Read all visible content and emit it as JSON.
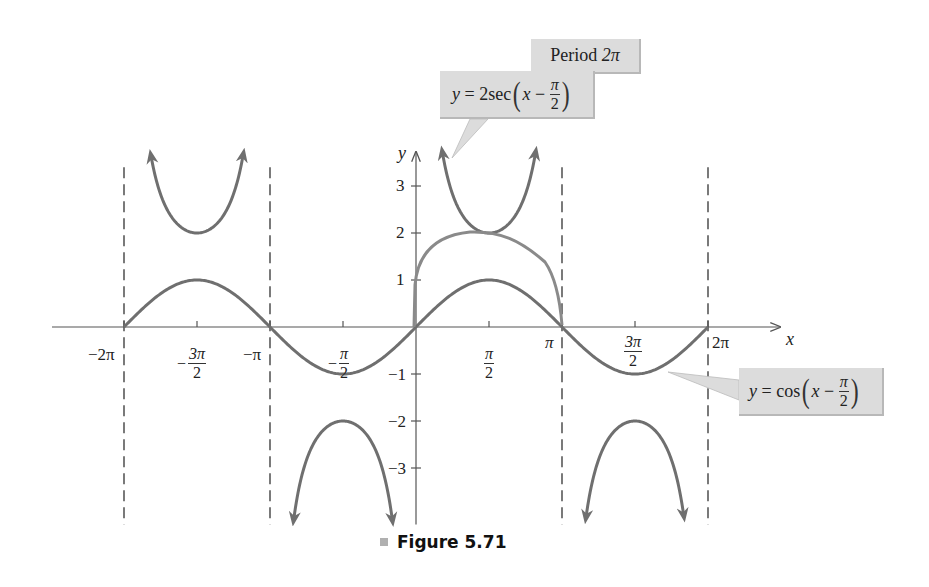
{
  "chart_data": {
    "type": "line",
    "title": "",
    "caption": "Figure 5.71",
    "xlabel": "x",
    "ylabel": "y",
    "xlim": [
      -6.2832,
      7.0
    ],
    "ylim": [
      -4.2,
      4.0
    ],
    "grid": false,
    "legend": "callouts",
    "x_ticks": [
      {
        "value": -6.2832,
        "label": "−2π"
      },
      {
        "value": -4.7124,
        "label": "−3π/2"
      },
      {
        "value": -3.1416,
        "label": "−π"
      },
      {
        "value": -1.5708,
        "label": "−π/2"
      },
      {
        "value": 1.5708,
        "label": "π/2"
      },
      {
        "value": 3.1416,
        "label": "π"
      },
      {
        "value": 4.7124,
        "label": "3π/2"
      },
      {
        "value": 6.2832,
        "label": "2π"
      }
    ],
    "y_ticks": [
      {
        "value": 3,
        "label": "3"
      },
      {
        "value": 2,
        "label": "2"
      },
      {
        "value": 1,
        "label": "1"
      },
      {
        "value": -1,
        "label": "−1"
      },
      {
        "value": -2,
        "label": "−2"
      },
      {
        "value": -3,
        "label": "−3"
      }
    ],
    "series": [
      {
        "name": "y = cos(x − π/2)",
        "expression": "cos(x - pi/2)",
        "x_range": [
          -6.2832,
          6.2832
        ],
        "x": [
          -6.2832,
          -4.7124,
          -3.1416,
          -1.5708,
          0,
          1.5708,
          3.1416,
          4.7124,
          6.2832
        ],
        "values": [
          0,
          1,
          0,
          -1,
          0,
          1,
          0,
          -1,
          0
        ]
      },
      {
        "name": "y = 2sec(x − π/2)",
        "expression": "2/cos(x - pi/2)",
        "branches": [
          {
            "x_range": [
              -5.7,
              -3.72
            ],
            "vertex": {
              "x": -4.7124,
              "y": 2
            }
          },
          {
            "x_range": [
              -2.63,
              -0.51
            ],
            "vertex": {
              "x": -1.5708,
              "y": -2
            }
          },
          {
            "x_range": [
              0.57,
              2.57
            ],
            "vertex": {
              "x": 1.5708,
              "y": 2
            }
          },
          {
            "x_range": [
              3.66,
              5.76
            ],
            "vertex": {
              "x": 4.7124,
              "y": -2
            }
          }
        ]
      }
    ],
    "asymptotes": [
      -6.2832,
      -3.1416,
      3.1416,
      6.2832
    ],
    "annotations": [
      {
        "text": "Period 2π"
      },
      {
        "text": "y = 2sec(x − π/2)",
        "points_to": {
          "x": 0.7,
          "y": 3.3
        }
      },
      {
        "text": "y = cos(x − π/2)",
        "points_to": {
          "x": 5.3,
          "y": -0.9
        }
      }
    ]
  },
  "labels": {
    "axis_x": "x",
    "axis_y": "y",
    "y_ticks": {
      "p3": "3",
      "p2": "2",
      "p1": "1",
      "m1": "−1",
      "m2": "−2",
      "m3": "−3"
    },
    "x_ticks": {
      "m2pi": "−2π",
      "m3pi2_num": "3π",
      "m3pi2_den": "2",
      "minus": "−",
      "mpi": "−π",
      "mpi2_num": "π",
      "mpi2_den": "2",
      "pi2_num": "π",
      "pi2_den": "2",
      "pi": "π",
      "p3pi2_num": "3π",
      "p3pi2_den": "2",
      "p2pi": "2π"
    }
  },
  "callouts": {
    "period": {
      "label": "Period",
      "value": "2π"
    },
    "sec": {
      "y": "y",
      "eq": " = 2sec",
      "x": "x",
      "minus": " − ",
      "num": "π",
      "den": "2"
    },
    "cos": {
      "y": "y",
      "eq": " = cos",
      "x": "x",
      "minus": " − ",
      "num": "π",
      "den": "2"
    }
  },
  "caption": {
    "text": "Figure 5.71"
  },
  "colors": {
    "curve": "#6f6f6f",
    "axis": "#555555",
    "callout_bg": "#dcdcdc",
    "text": "#222222"
  }
}
